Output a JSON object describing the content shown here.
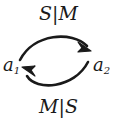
{
  "diagram": {
    "type": "state-transition-diagram",
    "background_color": "#ffffff",
    "stroke_color": "#1a1a1a",
    "nodes": [
      {
        "id": "a1",
        "base": "a",
        "subscript": "1",
        "position": "left"
      },
      {
        "id": "a2",
        "base": "a",
        "subscript": "2",
        "position": "right"
      }
    ],
    "edges": [
      {
        "id": "edge-top",
        "from": "a1",
        "to": "a2",
        "label": "S|M",
        "curve": "arc-upward",
        "label_position": "top",
        "arrowhead": "end"
      },
      {
        "id": "edge-bottom",
        "from": "a2",
        "to": "a1",
        "label": "M|S",
        "curve": "arc-downward",
        "label_position": "bottom",
        "arrowhead": "end"
      }
    ]
  }
}
